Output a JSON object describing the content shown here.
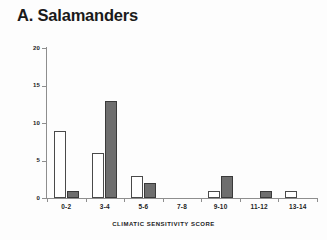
{
  "figure": {
    "panel_label": "A. Salamanders"
  },
  "chart_data": {
    "type": "bar",
    "title": "A. Salamanders",
    "xlabel": "CLIMATIC SENSITIVITY SCORE",
    "ylabel": "FREQUENCY",
    "categories": [
      "0-2",
      "3-4",
      "5-6",
      "7-8",
      "9-10",
      "11-12",
      "13-14"
    ],
    "series": [
      {
        "name": "open",
        "fill": "#ffffff",
        "values": [
          9,
          6,
          3,
          0,
          1,
          0,
          1
        ]
      },
      {
        "name": "filled",
        "fill": "#6e6e6e",
        "values": [
          1,
          13,
          2,
          0,
          3,
          1,
          0
        ]
      }
    ],
    "ylim": [
      0,
      20
    ],
    "yticks": [
      0,
      5,
      10,
      15,
      20
    ],
    "ytick_labels": [
      "0",
      "5",
      "10",
      "15",
      "20"
    ],
    "grid": false,
    "legend": "none"
  },
  "colors": {
    "open_bar": "#ffffff",
    "open_bar_edge": "#4a4a4a",
    "filled_bar": "#6e6e6e",
    "filled_bar_edge": "#3a3a3a",
    "axis": "#8e8e8e",
    "text": "#1a1a1a",
    "background": "#fdfdfd"
  }
}
